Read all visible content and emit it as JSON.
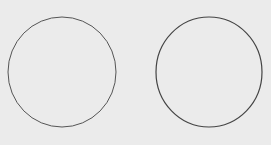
{
  "image": {
    "description": "Two hand-drawn circles side by side on light gray paper",
    "background": "#ebebeb",
    "stroke_color": "#3a3a3a",
    "shapes": [
      {
        "type": "circle",
        "cx": 62,
        "cy": 72,
        "rx": 54,
        "ry": 55
      },
      {
        "type": "circle",
        "cx": 209,
        "cy": 72,
        "rx": 53,
        "ry": 55
      }
    ]
  }
}
